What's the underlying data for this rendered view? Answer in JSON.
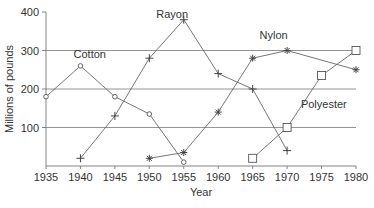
{
  "chart_data": {
    "type": "line",
    "title": "",
    "xlabel": "Year",
    "ylabel": "Millions of pounds",
    "xlim": [
      1935,
      1980
    ],
    "ylim": [
      0,
      400
    ],
    "x_ticks": [
      1935,
      1940,
      1945,
      1950,
      1955,
      1960,
      1965,
      1970,
      1975,
      1980
    ],
    "y_ticks": [
      100,
      200,
      300,
      400
    ],
    "gridlines": [
      100,
      200,
      300
    ],
    "legend": "inline labels",
    "series": [
      {
        "name": "Cotton",
        "marker": "circle",
        "points": [
          [
            1935,
            180
          ],
          [
            1940,
            260
          ],
          [
            1945,
            180
          ],
          [
            1950,
            135
          ],
          [
            1955,
            10
          ]
        ]
      },
      {
        "name": "Rayon",
        "marker": "plus",
        "points": [
          [
            1940,
            20
          ],
          [
            1945,
            130
          ],
          [
            1950,
            280
          ],
          [
            1955,
            380
          ],
          [
            1960,
            240
          ],
          [
            1965,
            200
          ],
          [
            1970,
            40
          ]
        ]
      },
      {
        "name": "Nylon",
        "marker": "star",
        "points": [
          [
            1950,
            20
          ],
          [
            1955,
            35
          ],
          [
            1960,
            140
          ],
          [
            1965,
            280
          ],
          [
            1970,
            300
          ],
          [
            1980,
            250
          ]
        ]
      },
      {
        "name": "Polyester",
        "marker": "square",
        "points": [
          [
            1965,
            20
          ],
          [
            1970,
            100
          ],
          [
            1975,
            235
          ],
          [
            1980,
            300
          ]
        ]
      }
    ],
    "labels": [
      {
        "text": "Cotton",
        "x": 1939,
        "y": 280
      },
      {
        "text": "Rayon",
        "x": 1951,
        "y": 385
      },
      {
        "text": "Nylon",
        "x": 1966,
        "y": 330
      },
      {
        "text": "Polyester",
        "x": 1972,
        "y": 150
      }
    ]
  }
}
